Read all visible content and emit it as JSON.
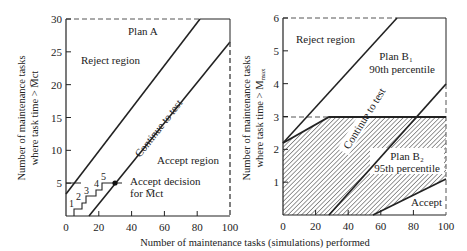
{
  "figure": {
    "x_axis_label": "Number of maintenance tasks (simulations) performed",
    "colors": {
      "ink": "#222222",
      "grid_dash": "#555555",
      "background": "#ffffff"
    }
  },
  "chart_data": [
    {
      "type": "line",
      "title": "Plan A",
      "xlabel": "Number of maintenance tasks (simulations) performed",
      "ylabel_line1": "Number of maintenance tasks",
      "ylabel_line2": "where task time > M̅ct",
      "xlim": [
        0,
        100
      ],
      "ylim": [
        0,
        30
      ],
      "x_ticks": [
        "0",
        "20",
        "40",
        "60",
        "80",
        "100"
      ],
      "y_ticks": [
        "5",
        "10",
        "15",
        "20",
        "25",
        "30"
      ],
      "series": [
        {
          "name": "Reject boundary",
          "points": [
            [
              0,
              3.3
            ],
            [
              82,
              30
            ]
          ]
        },
        {
          "name": "Accept boundary",
          "points": [
            [
              14,
              0
            ],
            [
              100,
              26.5
            ]
          ]
        },
        {
          "name": "Sample path (staircase)",
          "points": [
            [
              5,
              0
            ],
            [
              5,
              1
            ],
            [
              10,
              1
            ],
            [
              10,
              2
            ],
            [
              12,
              2
            ],
            [
              12,
              3
            ],
            [
              18,
              3
            ],
            [
              18,
              4
            ],
            [
              22,
              4
            ],
            [
              22,
              5
            ],
            [
              30,
              5
            ]
          ]
        }
      ],
      "annotations": {
        "reject_region": "Reject region",
        "continue": "Continue to test",
        "accept_region": "Accept region",
        "accept_decision_line1": "Accept decision",
        "accept_decision_line2": "for M̅ct",
        "step_labels": [
          "1",
          "2",
          "3",
          "4",
          "5"
        ],
        "decision_point": [
          30,
          5
        ]
      }
    },
    {
      "type": "line",
      "title_b1_line1": "Plan B₁",
      "title_b1_line2": "90th percentile",
      "title_b2_line1": "Plan B₂",
      "title_b2_line2": "95th percentile",
      "xlabel": "Number of maintenance tasks (simulations) performed",
      "ylabel_line1": "Number of maintenance tasks",
      "ylabel_line2": "where task time > M",
      "ylabel_sub": "max",
      "xlim": [
        0,
        100
      ],
      "ylim": [
        0,
        6
      ],
      "x_ticks": [
        "0",
        "20",
        "40",
        "60",
        "80",
        "100"
      ],
      "y_ticks": [
        "1",
        "2",
        "3",
        "4",
        "5",
        "6"
      ],
      "series": [
        {
          "name": "Plan B1 reject boundary",
          "points": [
            [
              0,
              2.2
            ],
            [
              70,
              6
            ]
          ]
        },
        {
          "name": "Plan B1 accept boundary",
          "points": [
            [
              28,
              0
            ],
            [
              100,
              4
            ]
          ]
        },
        {
          "name": "Plan B2 reject boundary",
          "points": [
            [
              0,
              2.2
            ],
            [
              28,
              3
            ],
            [
              100,
              3
            ]
          ]
        },
        {
          "name": "Plan B2 accept boundary",
          "points": [
            [
              55,
              0
            ],
            [
              100,
              1.1
            ]
          ]
        }
      ],
      "annotations": {
        "reject_region": "Reject region",
        "continue": "Continue to test",
        "accept": "Accept",
        "hatched_region": "Plan B2 continue-to-test region"
      }
    }
  ]
}
